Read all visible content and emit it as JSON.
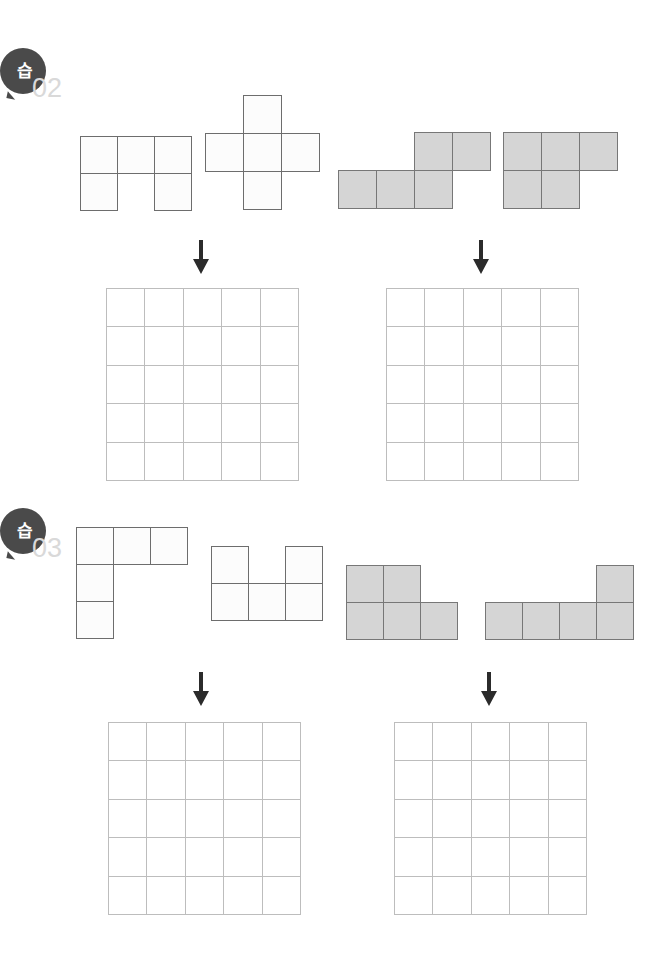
{
  "document": {
    "type": "worksheet",
    "title": "",
    "background_color": "#ffffff",
    "width": 670,
    "height": 976
  },
  "palette": {
    "badge_fill": "#4a4a4a",
    "badge_text": "#ffffff",
    "problem_number": "#d9d9d9",
    "shape_white_fill": "#fcfcfc",
    "shape_white_stroke": "#6d6d6d",
    "shape_gray_fill": "#d5d5d5",
    "shape_gray_stroke": "#777777",
    "grid_line": "#bdbdbd",
    "grid_cell": "#ffffff",
    "arrow": "#2b2b2b"
  },
  "problems": [
    {
      "id": "problem-02",
      "badge_label": "습",
      "number_label": "02",
      "badge": {
        "x": 0,
        "y": 48,
        "size": 46
      },
      "number": {
        "x": 32,
        "y": 75
      },
      "shapes": [
        {
          "id": "shape-02-1",
          "name": "u-pentomino-outline",
          "fill": "white",
          "x": 80,
          "y": 136,
          "cell": 37,
          "cells": [
            [
              0,
              0
            ],
            [
              1,
              0
            ],
            [
              2,
              0
            ],
            [
              0,
              1
            ],
            [
              2,
              1
            ]
          ]
        },
        {
          "id": "shape-02-2",
          "name": "plus-pentomino-outline",
          "fill": "white",
          "x": 205,
          "y": 95,
          "cell": 38,
          "cells": [
            [
              1,
              0
            ],
            [
              0,
              1
            ],
            [
              1,
              1
            ],
            [
              2,
              1
            ],
            [
              1,
              2
            ]
          ]
        },
        {
          "id": "shape-02-3",
          "name": "n-pentomino-gray",
          "fill": "gray",
          "x": 338,
          "y": 132,
          "cell": 38,
          "cells": [
            [
              2,
              0
            ],
            [
              3,
              0
            ],
            [
              0,
              1
            ],
            [
              1,
              1
            ],
            [
              2,
              1
            ]
          ]
        },
        {
          "id": "shape-02-4",
          "name": "p-pentomino-gray",
          "fill": "gray",
          "x": 503,
          "y": 132,
          "cell": 38,
          "cells": [
            [
              0,
              0
            ],
            [
              1,
              0
            ],
            [
              2,
              0
            ],
            [
              0,
              1
            ],
            [
              1,
              1
            ]
          ]
        }
      ],
      "arrows": [
        {
          "id": "arrow-02-left",
          "x": 190,
          "y": 240,
          "direction": "down"
        },
        {
          "id": "arrow-02-right",
          "x": 470,
          "y": 240,
          "direction": "down"
        }
      ],
      "grids": [
        {
          "id": "grid-02-left",
          "x": 106,
          "y": 288,
          "size": 193,
          "rows": 5,
          "cols": 5
        },
        {
          "id": "grid-02-right",
          "x": 386,
          "y": 288,
          "size": 193,
          "rows": 5,
          "cols": 5
        }
      ]
    },
    {
      "id": "problem-03",
      "badge_label": "습",
      "number_label": "03",
      "badge": {
        "x": 0,
        "y": 508,
        "size": 46
      },
      "number": {
        "x": 32,
        "y": 535
      },
      "shapes": [
        {
          "id": "shape-03-1",
          "name": "v-pentomino-outline",
          "fill": "white",
          "x": 76,
          "y": 527,
          "cell": 37,
          "cells": [
            [
              0,
              0
            ],
            [
              1,
              0
            ],
            [
              2,
              0
            ],
            [
              0,
              1
            ],
            [
              0,
              2
            ]
          ]
        },
        {
          "id": "shape-03-2",
          "name": "u-pentomino-outline",
          "fill": "white",
          "x": 211,
          "y": 546,
          "cell": 37,
          "cells": [
            [
              0,
              0
            ],
            [
              2,
              0
            ],
            [
              0,
              1
            ],
            [
              1,
              1
            ],
            [
              2,
              1
            ]
          ]
        },
        {
          "id": "shape-03-3",
          "name": "p-pentomino-gray",
          "fill": "gray",
          "x": 346,
          "y": 565,
          "cell": 37,
          "cells": [
            [
              0,
              0
            ],
            [
              1,
              0
            ],
            [
              0,
              1
            ],
            [
              1,
              1
            ],
            [
              2,
              1
            ]
          ]
        },
        {
          "id": "shape-03-4",
          "name": "l-pentomino-gray",
          "fill": "gray",
          "x": 485,
          "y": 565,
          "cell": 37,
          "cells": [
            [
              3,
              0
            ],
            [
              0,
              1
            ],
            [
              1,
              1
            ],
            [
              2,
              1
            ],
            [
              3,
              1
            ]
          ]
        }
      ],
      "arrows": [
        {
          "id": "arrow-03-left",
          "x": 190,
          "y": 672,
          "direction": "down"
        },
        {
          "id": "arrow-03-right",
          "x": 478,
          "y": 672,
          "direction": "down"
        }
      ],
      "grids": [
        {
          "id": "grid-03-left",
          "x": 108,
          "y": 722,
          "size": 193,
          "rows": 5,
          "cols": 5
        },
        {
          "id": "grid-03-right",
          "x": 394,
          "y": 722,
          "size": 193,
          "rows": 5,
          "cols": 5
        }
      ]
    }
  ]
}
